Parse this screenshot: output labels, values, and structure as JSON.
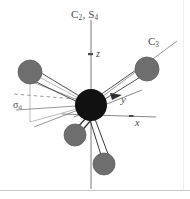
{
  "figure": {
    "kind": "molecular-symmetry-diagram",
    "background_color": "#ffffff",
    "frame": {
      "bottom_rule_color": "#c9c9c9",
      "right_rule_color": "#e0e0e0"
    },
    "labels": {
      "principal_axis": "C₂, S₄",
      "principal_axis_parts": {
        "base1": "C",
        "sub1": "2",
        "sep": ", ",
        "base2": "S",
        "sub2": "4"
      },
      "c3_axis": "C₃",
      "c3_axis_parts": {
        "base": "C",
        "sub": "3"
      },
      "mirror_plane": "σ_d",
      "mirror_plane_parts": {
        "base": "σ",
        "sub": "d"
      },
      "axis_z": "z",
      "axis_y": "y",
      "axis_x": "x"
    },
    "colors": {
      "central_atom": "#111111",
      "ligand_atom": "#6e6e6e",
      "ligand_atom_edge": "#5a5a5a",
      "bond": "#3a3a3a",
      "axis_line": "#7a7a7a",
      "symmetry_line": "#8a8a8a",
      "dashed_line": "#9a9a9a",
      "plane_outline": "#b0b0b0",
      "text": "#4a4a4a"
    },
    "central_atom": {
      "cx": 91,
      "cy": 105,
      "r": 16
    },
    "ligand_atoms": [
      {
        "name": "ligand-upper-left",
        "cx": 30,
        "cy": 72,
        "r": 12
      },
      {
        "name": "ligand-upper-right",
        "cx": 147,
        "cy": 69,
        "r": 12
      },
      {
        "name": "ligand-lower-left",
        "cx": 75,
        "cy": 135,
        "r": 11
      },
      {
        "name": "ligand-lower-right",
        "cx": 104,
        "cy": 164,
        "r": 11
      }
    ],
    "axes": [
      {
        "name": "z-axis",
        "x1": 91,
        "y1": 190,
        "x2": 91,
        "y2": 18
      },
      {
        "name": "y-axis",
        "x1": 76,
        "y1": 116,
        "x2": 141,
        "y2": 91
      },
      {
        "name": "x-axis",
        "x1": 63,
        "y1": 114,
        "x2": 155,
        "y2": 117
      }
    ],
    "symmetry_lines": [
      {
        "name": "c3-axis-line",
        "x1": 91,
        "y1": 105,
        "x2": 177,
        "y2": 41
      },
      {
        "name": "sigma-d-line-left",
        "x1": 91,
        "y1": 105,
        "x2": 17,
        "y2": 109
      },
      {
        "name": "sigma-d-line-lower-left",
        "x1": 91,
        "y1": 105,
        "x2": 36,
        "y2": 126
      }
    ],
    "dashed_line": {
      "name": "dashed-sigma-d-edge",
      "x1": 89,
      "y1": 100,
      "x2": 13,
      "y2": 94
    },
    "plane_outline": {
      "name": "sigma-d-plane-outline",
      "points": "30,72 30,122 91,105"
    },
    "arrowheads": [
      {
        "name": "z-arrowhead",
        "x": 91,
        "y": 54
      },
      {
        "name": "y-arrowhead",
        "x": 116,
        "y": 97
      },
      {
        "name": "x-arrowhead",
        "x": 131,
        "y": 116
      }
    ]
  }
}
